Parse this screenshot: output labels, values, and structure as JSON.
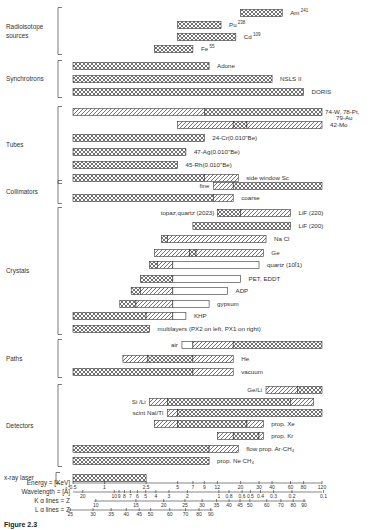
{
  "chart_data": {
    "type": "bar",
    "subtype": "range (Gantt-style) horizontal bars",
    "x_axis": {
      "scale": "log (wavelength-based)",
      "energy_keV_label": "Energy = [KeV]",
      "energy_ticks": [
        "0.5",
        "1",
        "2.5",
        "5",
        "7",
        "9",
        "12",
        "20",
        "30",
        "40",
        "60",
        "80",
        "120"
      ],
      "wavelength_label": "Wavelength = [Å]",
      "wavelength_ticks": [
        "20",
        "10",
        "9",
        "8",
        "7",
        "6",
        "5",
        "4",
        "3",
        "2",
        "1",
        "0.8",
        "0.6",
        "0.5",
        "0.4",
        "0.3",
        "0.2",
        "0.1"
      ],
      "k_alpha_label": "K α lines = Z",
      "k_alpha_ticks": [
        "10",
        "15",
        "20",
        "25",
        "30",
        "35",
        "40",
        "45",
        "50",
        "60",
        "70",
        "80",
        "90"
      ],
      "l_alpha_label": "L α lines = Z",
      "l_alpha_ticks": [
        "25",
        "30",
        "35",
        "40",
        "45",
        "50",
        "60",
        "70",
        "80",
        "90"
      ],
      "range_keV": [
        0.5,
        120
      ]
    },
    "legend": {
      "crosshatch": "primary / most useful range",
      "diagonal": "usable range",
      "open": "marginal range"
    },
    "groups": [
      {
        "name": "Radioisotope sources",
        "items": [
          {
            "label": "Am",
            "sup": "241",
            "segments": [
              {
                "from": 20,
                "to": 50,
                "fill": "crosshatch"
              }
            ]
          },
          {
            "label": "Pu",
            "sup": "238",
            "segments": [
              {
                "from": 5,
                "to": 13,
                "fill": "crosshatch"
              }
            ]
          },
          {
            "label": "Cd",
            "sup": "109",
            "segments": [
              {
                "from": 5,
                "to": 18,
                "fill": "crosshatch"
              }
            ]
          },
          {
            "label": "Fe",
            "sup": "55",
            "segments": [
              {
                "from": 3,
                "to": 7,
                "fill": "crosshatch"
              }
            ]
          }
        ]
      },
      {
        "name": "Synchrotrons",
        "items": [
          {
            "label": "Adone",
            "sup": "",
            "segments": [
              {
                "from": 0.5,
                "to": 10,
                "fill": "crosshatch"
              }
            ]
          },
          {
            "label": "NSLS II",
            "sup": "",
            "segments": [
              {
                "from": 0.5,
                "to": 40,
                "fill": "crosshatch"
              }
            ]
          },
          {
            "label": "DORIS",
            "sup": "",
            "segments": [
              {
                "from": 0.5,
                "to": 80,
                "fill": "crosshatch"
              }
            ]
          }
        ]
      },
      {
        "name": "Tubes",
        "items": [
          {
            "label": "74-W, 78-Pt, 79-Au",
            "sup": "",
            "segments": [
              {
                "from": 0.5,
                "to": 9,
                "fill": "diagonal"
              },
              {
                "from": 9,
                "to": 120,
                "fill": "crosshatch"
              }
            ]
          },
          {
            "label": "42-Mo",
            "sup": "",
            "segments": [
              {
                "from": 5,
                "to": 17,
                "fill": "diagonal"
              },
              {
                "from": 17,
                "to": 23,
                "fill": "crosshatch"
              },
              {
                "from": 23,
                "to": 120,
                "fill": "diagonal"
              }
            ]
          },
          {
            "label": "24-Cr(0.010\"Be)",
            "sup": "",
            "segments": [
              {
                "from": 0.5,
                "to": 9,
                "fill": "crosshatch"
              }
            ]
          },
          {
            "label": "47-Ag(0.010\"Be)",
            "sup": "",
            "segments": [
              {
                "from": 0.5,
                "to": 6,
                "fill": "crosshatch"
              }
            ]
          },
          {
            "label": "45-Rh(0.010\"Be)",
            "sup": "",
            "segments": [
              {
                "from": 0.5,
                "to": 5,
                "fill": "crosshatch"
              }
            ]
          },
          {
            "label": "side window Sc",
            "sup": "",
            "segments": [
              {
                "from": 0.5,
                "to": 9,
                "fill": "crosshatch"
              },
              {
                "from": 9,
                "to": 19,
                "fill": "diagonal"
              }
            ]
          }
        ]
      },
      {
        "name": "Collimators",
        "items": [
          {
            "label": "fine",
            "sup": "",
            "label_side": "left",
            "segments": [
              {
                "from": 11,
                "to": 17,
                "fill": "diagonal"
              },
              {
                "from": 17,
                "to": 120,
                "fill": "crosshatch"
              }
            ]
          },
          {
            "label": "coarse",
            "sup": "",
            "segments": [
              {
                "from": 0.5,
                "to": 11,
                "fill": "crosshatch"
              },
              {
                "from": 11,
                "to": 17,
                "fill": "diagonal"
              }
            ]
          }
        ]
      },
      {
        "name": "Crystals",
        "items": [
          {
            "label": "LiF (220)",
            "sup": "",
            "left_label": "topaz,quartz (2023)",
            "segments": [
              {
                "from": 12,
                "to": 20,
                "fill": "crosshatch"
              },
              {
                "from": 20,
                "to": 60,
                "fill": "diagonal"
              }
            ]
          },
          {
            "label": "LiF (200)",
            "sup": "",
            "segments": [
              {
                "from": 7,
                "to": 60,
                "fill": "crosshatch"
              }
            ]
          },
          {
            "label": "Na Cl",
            "sup": "",
            "segments": [
              {
                "from": 3.5,
                "to": 4,
                "fill": "crosshatch"
              },
              {
                "from": 4,
                "to": 35,
                "fill": "diagonal"
              }
            ]
          },
          {
            "label": "Ge",
            "sup": "",
            "segments": [
              {
                "from": 3,
                "to": 6.5,
                "fill": "diagonal"
              },
              {
                "from": 6.5,
                "to": 7.5,
                "fill": "crosshatch"
              },
              {
                "from": 7.5,
                "to": 33,
                "fill": "diagonal"
              }
            ]
          },
          {
            "label": "quartz (10Ī1)",
            "sup": "",
            "segments": [
              {
                "from": 2.7,
                "to": 3.2,
                "fill": "crosshatch"
              },
              {
                "from": 3.2,
                "to": 4.5,
                "fill": "diagonal"
              },
              {
                "from": 4.5,
                "to": 30,
                "fill": "open"
              }
            ]
          },
          {
            "label": "PET, EDDT",
            "sup": "",
            "segments": [
              {
                "from": 2.2,
                "to": 4.5,
                "fill": "crosshatch"
              },
              {
                "from": 4.5,
                "to": 20,
                "fill": "open"
              }
            ]
          },
          {
            "label": "ADP",
            "sup": "",
            "segments": [
              {
                "from": 1.8,
                "to": 2.2,
                "fill": "crosshatch"
              },
              {
                "from": 2.2,
                "to": 4.5,
                "fill": "diagonal"
              },
              {
                "from": 4.5,
                "to": 15,
                "fill": "open"
              }
            ]
          },
          {
            "label": "gypsum",
            "sup": "",
            "segments": [
              {
                "from": 1.4,
                "to": 2,
                "fill": "crosshatch"
              },
              {
                "from": 2,
                "to": 4.5,
                "fill": "diagonal"
              },
              {
                "from": 4.5,
                "to": 10,
                "fill": "open"
              }
            ]
          },
          {
            "label": "KHP",
            "sup": "",
            "segments": [
              {
                "from": 0.5,
                "to": 2.5,
                "fill": "crosshatch"
              },
              {
                "from": 2.5,
                "to": 4.5,
                "fill": "diagonal"
              },
              {
                "from": 4.5,
                "to": 6,
                "fill": "open"
              }
            ]
          },
          {
            "label": "multilayers (PX2 on left, PX1 on right)",
            "sup": "",
            "segments": [
              {
                "from": 0.5,
                "to": 2.7,
                "fill": "crosshatch"
              }
            ]
          }
        ]
      },
      {
        "name": "Paths",
        "items": [
          {
            "label": "air",
            "sup": "",
            "label_side": "left",
            "segments": [
              {
                "from": 5.5,
                "to": 7,
                "fill": "open"
              },
              {
                "from": 7,
                "to": 17,
                "fill": "diagonal"
              },
              {
                "from": 17,
                "to": 120,
                "fill": "crosshatch"
              }
            ]
          },
          {
            "label": "He",
            "sup": "",
            "segments": [
              {
                "from": 1.5,
                "to": 2.6,
                "fill": "diagonal"
              },
              {
                "from": 2.6,
                "to": 7,
                "fill": "crosshatch"
              },
              {
                "from": 7,
                "to": 17,
                "fill": "diagonal"
              }
            ]
          },
          {
            "label": "vacuum",
            "sup": "",
            "segments": [
              {
                "from": 0.5,
                "to": 7,
                "fill": "crosshatch"
              },
              {
                "from": 7,
                "to": 17,
                "fill": "diagonal"
              }
            ]
          }
        ]
      },
      {
        "name": "Detectors",
        "items": [
          {
            "label": "Ge/Li",
            "sup": "",
            "label_side": "left",
            "segments": [
              {
                "from": 35,
                "to": 70,
                "fill": "diagonal"
              },
              {
                "from": 70,
                "to": 120,
                "fill": "crosshatch"
              }
            ]
          },
          {
            "label": "Si /Li",
            "sup": "",
            "label_side": "left",
            "segments": [
              {
                "from": 2.7,
                "to": 4,
                "fill": "diagonal"
              },
              {
                "from": 4,
                "to": 60,
                "fill": "crosshatch"
              },
              {
                "from": 60,
                "to": 100,
                "fill": "diagonal"
              }
            ]
          },
          {
            "label": "scint NaI/Tl",
            "sup": "",
            "label_side": "left",
            "segments": [
              {
                "from": 4,
                "to": 5,
                "fill": "diagonal"
              },
              {
                "from": 5,
                "to": 120,
                "fill": "crosshatch"
              }
            ]
          },
          {
            "label": "prop. Xe",
            "sup": "",
            "segments": [
              {
                "from": 3,
                "to": 5,
                "fill": "diagonal"
              },
              {
                "from": 5,
                "to": 23,
                "fill": "crosshatch"
              },
              {
                "from": 23,
                "to": 33,
                "fill": "diagonal"
              }
            ]
          },
          {
            "label": "prop. Kr",
            "sup": "",
            "segments": [
              {
                "from": 12,
                "to": 17,
                "fill": "diagonal"
              },
              {
                "from": 17,
                "to": 30,
                "fill": "crosshatch"
              },
              {
                "from": 30,
                "to": 33,
                "fill": "diagonal"
              }
            ]
          },
          {
            "label": "flow prop. Ar-CH₄",
            "sup": "",
            "segments": [
              {
                "from": 0.5,
                "to": 10,
                "fill": "crosshatch"
              },
              {
                "from": 10,
                "to": 19,
                "fill": "diagonal"
              }
            ]
          },
          {
            "label": "prop. Ne CH₄",
            "sup": "",
            "segments": [
              {
                "from": 0.5,
                "to": 10,
                "fill": "crosshatch"
              }
            ]
          }
        ]
      },
      {
        "name": "x-ray laser",
        "items": [
          {
            "label": "",
            "sup": "",
            "segments": [
              {
                "from": 0.5,
                "to": 2.5,
                "fill": "crosshatch"
              }
            ]
          }
        ]
      }
    ]
  },
  "caption": "Figure 2.3"
}
